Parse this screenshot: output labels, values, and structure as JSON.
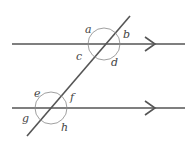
{
  "diagram": {
    "colors": {
      "line": "#555555",
      "arc": "#888888",
      "label": "#444444"
    },
    "top_intersection_labels": [
      "a",
      "b",
      "c",
      "d"
    ],
    "bottom_intersection_labels": [
      "e",
      "f",
      "g",
      "h"
    ],
    "labels": {
      "a": "a",
      "b": "b",
      "c": "c",
      "d": "d",
      "e": "e",
      "f": "f",
      "g": "g",
      "h": "h"
    }
  }
}
